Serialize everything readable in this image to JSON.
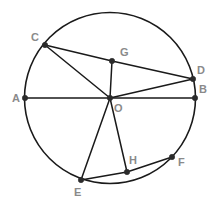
{
  "figure": {
    "kind": "circle-geometry-diagram",
    "background_color": "#ffffff",
    "stroke_color": "#1a1a1a",
    "label_color": "#8a8a8a",
    "vertex_color": "#2b2b2b",
    "width": 215,
    "height": 206
  },
  "circle": {
    "name": "main-circle",
    "center_label": "O",
    "cx": 110,
    "cy": 98,
    "r": 85.5
  },
  "points": [
    {
      "id": "A",
      "label": "A",
      "x": 25,
      "y": 98,
      "label_x": 12,
      "label_y": 102,
      "on_circle": true
    },
    {
      "id": "B",
      "label": "B",
      "x": 195,
      "y": 98,
      "label_x": 199,
      "label_y": 93,
      "on_circle": true
    },
    {
      "id": "C",
      "label": "C",
      "x": 45,
      "y": 45,
      "label_x": 31,
      "label_y": 41,
      "on_circle": true
    },
    {
      "id": "D",
      "label": "D",
      "x": 193,
      "y": 79,
      "label_x": 197,
      "label_y": 74,
      "on_circle": true
    },
    {
      "id": "E",
      "label": "E",
      "x": 81,
      "y": 180,
      "label_x": 74,
      "label_y": 196,
      "on_circle": true
    },
    {
      "id": "F",
      "label": "F",
      "x": 172,
      "y": 157,
      "label_x": 178,
      "label_y": 166,
      "on_circle": true
    },
    {
      "id": "G",
      "label": "G",
      "x": 112,
      "y": 61,
      "label_x": 120,
      "label_y": 56,
      "on_circle": false
    },
    {
      "id": "H",
      "label": "H",
      "x": 127,
      "y": 172,
      "label_x": 129,
      "label_y": 164,
      "on_circle": false
    },
    {
      "id": "O",
      "label": "O",
      "x": 110,
      "y": 98,
      "label_x": 114,
      "label_y": 112,
      "on_circle": false
    }
  ],
  "segments": [
    {
      "name": "segment-A-B",
      "from": "A",
      "to": "B"
    },
    {
      "name": "segment-C-O",
      "from": "C",
      "to": "O"
    },
    {
      "name": "segment-C-G",
      "from": "C",
      "to": "G"
    },
    {
      "name": "segment-G-D",
      "from": "G",
      "to": "D"
    },
    {
      "name": "segment-G-O",
      "from": "G",
      "to": "O"
    },
    {
      "name": "segment-O-D",
      "from": "O",
      "to": "D"
    },
    {
      "name": "segment-O-E",
      "from": "O",
      "to": "E"
    },
    {
      "name": "segment-O-H",
      "from": "O",
      "to": "H"
    },
    {
      "name": "segment-E-H",
      "from": "E",
      "to": "H"
    },
    {
      "name": "segment-H-F",
      "from": "H",
      "to": "F"
    }
  ]
}
